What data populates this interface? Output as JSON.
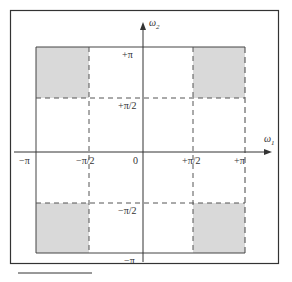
{
  "diagram": {
    "type": "frequency-domain-2d",
    "axes": {
      "horizontal": {
        "label": "ω1",
        "ticks": [
          "−π",
          "−π/2",
          "0",
          "+π/2",
          "+π"
        ]
      },
      "vertical": {
        "label": "ω2",
        "ticks": [
          "+π",
          "+π/2",
          "−π/2",
          "−π"
        ]
      }
    },
    "shaded_regions": [
      "top-left",
      "top-right",
      "bottom-left",
      "bottom-right"
    ],
    "colors": {
      "shade": "#d9d9d9",
      "line": "#333333",
      "background": "#ffffff"
    }
  },
  "labels": {
    "w2": "ω",
    "w2_sub": "2",
    "w1": "ω",
    "w1_sub": "1",
    "x_neg_pi": "−π",
    "x_neg_half_pi": "−π/2",
    "x_zero": "0",
    "x_pos_half_pi": "+π/2",
    "x_pos_pi": "+π",
    "y_pos_pi": "+π",
    "y_pos_half_pi": "+π/2",
    "y_neg_half_pi": "−π/2",
    "y_neg_pi": "−π"
  }
}
